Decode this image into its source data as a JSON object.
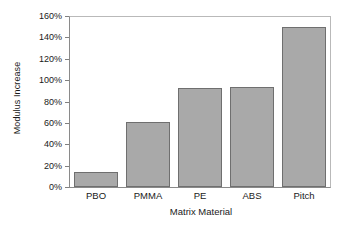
{
  "chart_data": {
    "type": "bar",
    "title": "",
    "xlabel": "Matrix Material",
    "ylabel": "Modulus Increase",
    "categories": [
      "PBO",
      "PMMA",
      "PE",
      "ABS",
      "Pitch"
    ],
    "values": [
      14,
      61,
      93,
      94,
      150
    ],
    "value_labels": [
      "14%",
      "61%",
      "93%",
      "94%",
      "150%"
    ],
    "ylim": [
      0,
      160
    ],
    "ytick_values": [
      0,
      20,
      40,
      60,
      80,
      100,
      120,
      140,
      160
    ],
    "ytick_labels": [
      "0%",
      "20%",
      "40%",
      "60%",
      "80%",
      "100%",
      "120%",
      "140%",
      "160%"
    ],
    "grid": false,
    "legend": null,
    "bar_color": "#a9a9a9",
    "bar_edge_color": "#6f6f6f",
    "axis_color": "#8a8a8a",
    "background_color": "#ffffff"
  }
}
